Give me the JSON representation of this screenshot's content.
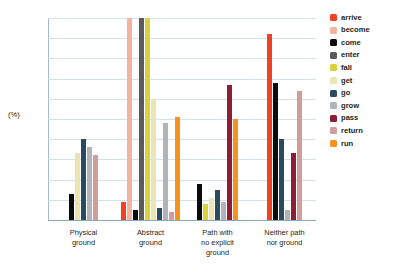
{
  "chart_data": {
    "type": "bar",
    "title": "",
    "xlabel": "",
    "ylabel": "(%)",
    "ylim": [
      0,
      100
    ],
    "ytick_labels": [
      "100",
      "90",
      "80",
      "70",
      "60",
      "50",
      "40",
      "30",
      "20",
      "10",
      "0"
    ],
    "ytick_values": [
      100,
      90,
      80,
      70,
      60,
      50,
      40,
      30,
      20,
      10,
      0
    ],
    "grid": true,
    "legend_position": "right",
    "categories": [
      "Physical ground",
      "Abstract ground",
      "Path with no explicit ground",
      "Neither path nor ground"
    ],
    "category_lines": [
      [
        "Physical",
        "ground"
      ],
      [
        "Abstract",
        "ground"
      ],
      [
        "Path with",
        "no explicit",
        "ground"
      ],
      [
        "Neither path",
        "nor ground"
      ]
    ],
    "series": [
      {
        "name": "arrive",
        "color": "#ef4123",
        "values": [
          0,
          9,
          0,
          92
        ]
      },
      {
        "name": "become",
        "color": "#f4b3a0",
        "values": [
          0,
          100,
          0,
          0
        ]
      },
      {
        "name": "come",
        "color": "#0d0c0c",
        "values": [
          13,
          5,
          18,
          68
        ]
      },
      {
        "name": "enter",
        "color": "#5b5b5b",
        "values": [
          0,
          100,
          0,
          0
        ]
      },
      {
        "name": "fall",
        "color": "#d9d23c",
        "values": [
          0,
          100,
          8,
          0
        ]
      },
      {
        "name": "get",
        "color": "#ece5b3",
        "values": [
          33,
          60,
          11,
          0
        ]
      },
      {
        "name": "go",
        "color": "#2c4a5e",
        "values": [
          40,
          6,
          15,
          40
        ]
      },
      {
        "name": "grow",
        "color": "#b0b3b8",
        "values": [
          36,
          48,
          9,
          5
        ]
      },
      {
        "name": "pass",
        "color": "#8c1f35",
        "values": [
          0,
          0,
          67,
          33
        ]
      },
      {
        "name": "return",
        "color": "#cf9d9b",
        "values": [
          32,
          4,
          0,
          64
        ]
      },
      {
        "name": "run",
        "color": "#f6921e",
        "values": [
          0,
          51,
          50,
          0
        ]
      }
    ]
  },
  "legend": {
    "items": [
      {
        "label": "arrive",
        "color": "#ef4123"
      },
      {
        "label": "become",
        "color": "#f4b3a0"
      },
      {
        "label": "come",
        "color": "#0d0c0c"
      },
      {
        "label": "enter",
        "color": "#5b5b5b"
      },
      {
        "label": "fall",
        "color": "#d9d23c"
      },
      {
        "label": "get",
        "color": "#ece5b3"
      },
      {
        "label": "go",
        "color": "#2c4a5e"
      },
      {
        "label": "grow",
        "color": "#b0b3b8"
      },
      {
        "label": "pass",
        "color": "#8c1f35"
      },
      {
        "label": "return",
        "color": "#cf9d9b"
      },
      {
        "label": "run",
        "color": "#f6921e"
      }
    ]
  },
  "axis": {
    "y_title": "(%)"
  }
}
